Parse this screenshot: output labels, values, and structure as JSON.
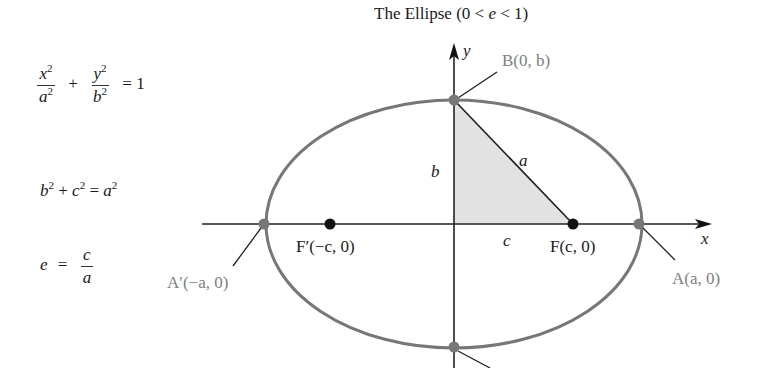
{
  "title": {
    "prefix": "The Ellipse (0 < ",
    "var": "e",
    "suffix": " < 1)"
  },
  "formulas": {
    "standard_form": {
      "x_num": "x",
      "x_den": "a",
      "plus": "+",
      "y_num": "y",
      "y_den": "b",
      "exp": "2",
      "rhs": "= 1"
    },
    "pythagorean": {
      "b": "b",
      "c": "c",
      "a": "a",
      "exp": "2",
      "plus": "+",
      "eq": "="
    },
    "eccentricity": {
      "lhs": "e",
      "eq": "=",
      "num": "c",
      "den": "a"
    }
  },
  "diagram": {
    "axes": {
      "x_label": "x",
      "y_label": "y"
    },
    "points": {
      "B": "B(0, b)",
      "A": "A(a, 0)",
      "A_prime": "A′(−a, 0)",
      "F": "F(c, 0)",
      "F_prime": "F′(−c, 0)"
    },
    "segments": {
      "a": "a",
      "b": "b",
      "c": "c"
    },
    "colors": {
      "ellipse": "#777777",
      "vertex_dot": "#777777",
      "focus_dot": "#111111",
      "triangle_fill": "#e0e0e0",
      "vertex_label": "#808080",
      "axis": "#222222"
    }
  }
}
